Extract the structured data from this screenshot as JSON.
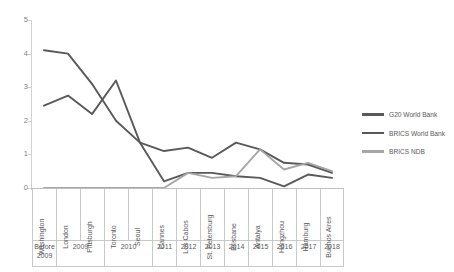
{
  "chart_data": {
    "type": "line",
    "title": "",
    "xlabel": "",
    "ylabel": "",
    "ylim": [
      0,
      5
    ],
    "yticks": [
      0,
      1,
      2,
      3,
      4,
      5
    ],
    "grid": false,
    "legend_position": "right",
    "categories": [
      "Washington",
      "London",
      "Pittsburgh",
      "Toronto",
      "Seoul",
      "Cannes",
      "Los Cabos",
      "St. Petersburg",
      "Brisbane",
      "Antalya",
      "Hangzhou",
      "Hamburg",
      "Buenos Aires"
    ],
    "year_groups": [
      {
        "label": "Before 2009",
        "span": 1
      },
      {
        "label": "2009",
        "span": 2
      },
      {
        "label": "2010",
        "span": 2
      },
      {
        "label": "2011",
        "span": 1
      },
      {
        "label": "2012",
        "span": 1
      },
      {
        "label": "2013",
        "span": 1
      },
      {
        "label": "2014",
        "span": 1
      },
      {
        "label": "2015",
        "span": 1
      },
      {
        "label": "2016",
        "span": 1
      },
      {
        "label": "2017",
        "span": 1
      },
      {
        "label": "2018",
        "span": 1
      }
    ],
    "series": [
      {
        "name": "G20 World Bank",
        "color": "#595959",
        "values": [
          4.1,
          4.0,
          3.1,
          2.0,
          1.35,
          0.2,
          0.45,
          0.45,
          0.35,
          0.3,
          0.05,
          0.4,
          0.3
        ]
      },
      {
        "name": "BRICS World Bank",
        "color": "#595959",
        "values": [
          2.45,
          2.75,
          2.2,
          3.2,
          1.35,
          1.1,
          1.2,
          0.9,
          1.35,
          1.15,
          0.75,
          0.7,
          0.45
        ]
      },
      {
        "name": "BRICS NDB",
        "color": "#a6a6a6",
        "values": [
          0.0,
          0.0,
          0.0,
          0.0,
          0.0,
          0.0,
          0.45,
          0.3,
          0.35,
          1.15,
          0.55,
          0.75,
          0.5
        ]
      }
    ]
  },
  "legend": {
    "items": [
      {
        "label": "G20 World Bank",
        "color": "#595959"
      },
      {
        "label": "BRICS World Bank",
        "color": "#595959"
      },
      {
        "label": "BRICS NDB",
        "color": "#a6a6a6"
      }
    ]
  }
}
